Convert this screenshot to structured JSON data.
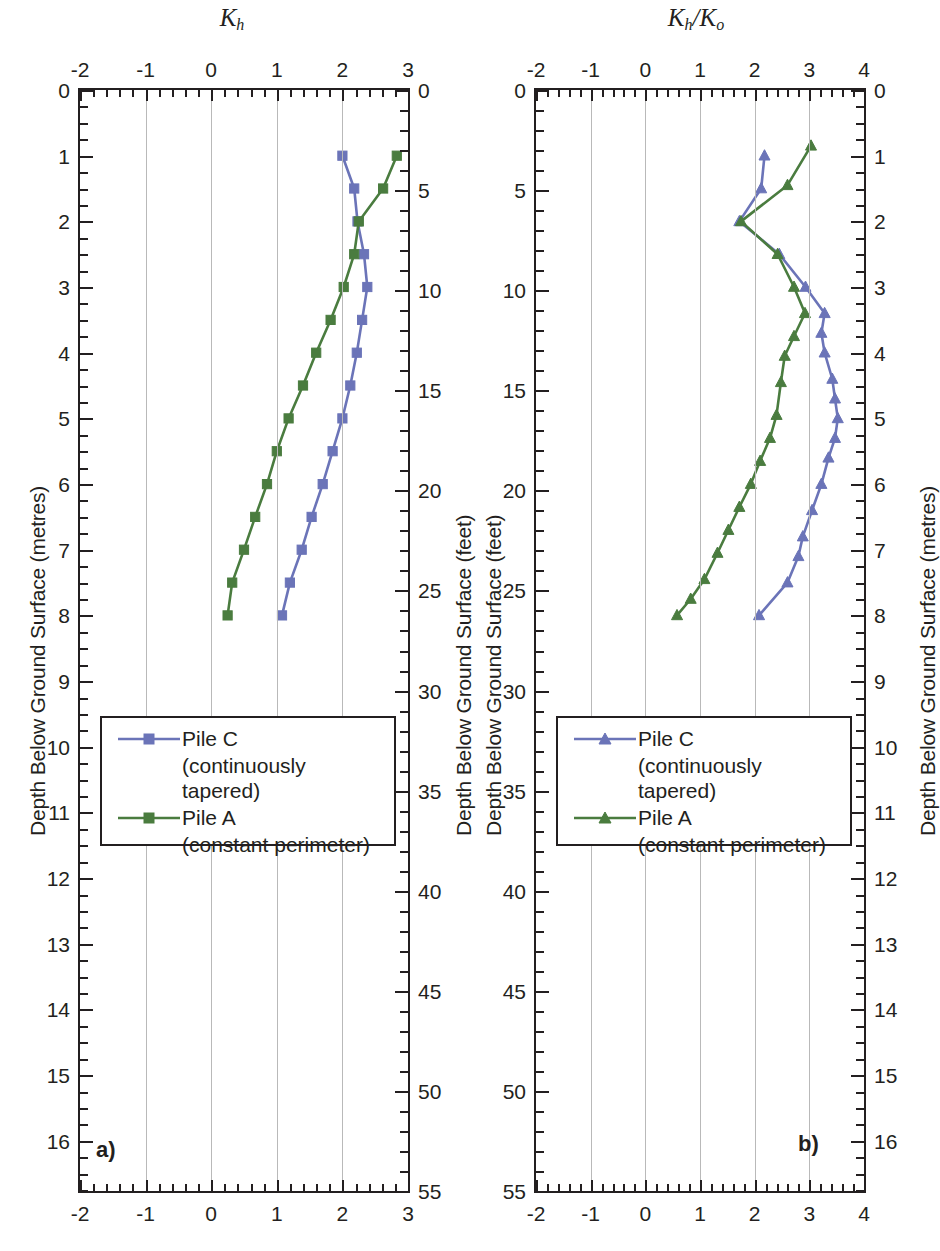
{
  "figure": {
    "panels": [
      {
        "tag": "a)",
        "x_axis_title": "K",
        "x_axis_title_sub": "h",
        "x_axis_title_full": "Kh",
        "x_ticks": [
          -2,
          -1,
          0,
          1,
          2,
          3
        ],
        "x_min": -2,
        "x_max": 3,
        "x_minor_step": 0.2,
        "left_axis_label": "Depth Below Ground Surface (metres)",
        "left_ticks": [
          0,
          1,
          2,
          3,
          4,
          5,
          6,
          7,
          8,
          9,
          10,
          11,
          12,
          13,
          14,
          15,
          16
        ],
        "left_min": 0,
        "left_max": 16.764,
        "left_minor_step": 0.25,
        "right_axis_label": "Depth Below Ground Surface (feet)",
        "right_ticks": [
          0,
          5,
          10,
          15,
          20,
          25,
          30,
          35,
          40,
          45,
          50,
          55
        ],
        "right_min": 0,
        "right_max": 55,
        "right_minor_step": 1,
        "legend": {
          "items": [
            {
              "name": "Pile C",
              "sub": "(continuously tapered)",
              "color": "#6b74b8",
              "marker": "square"
            },
            {
              "name": "Pile A",
              "sub": "(constant perimeter)",
              "color": "#4a7c3f",
              "marker": "square"
            }
          ]
        }
      },
      {
        "tag": "b)",
        "x_axis_title": "K",
        "x_axis_title_sub": "h",
        "x_axis_title_sub2": "o",
        "x_axis_title_full": "Kh/Ko",
        "x_ticks": [
          -2,
          -1,
          0,
          1,
          2,
          3,
          4
        ],
        "x_min": -2,
        "x_max": 4,
        "x_minor_step": 0.2,
        "left_axis_label": "Depth Below Ground Surface (feet)",
        "left_ticks": [
          0,
          5,
          10,
          15,
          20,
          25,
          30,
          35,
          40,
          45,
          50,
          55
        ],
        "left_min": 0,
        "left_max": 55,
        "left_minor_step": 1,
        "right_axis_label": "Depth Below Ground Surface (metres)",
        "right_ticks": [
          0,
          1,
          2,
          3,
          4,
          5,
          6,
          7,
          8,
          9,
          10,
          11,
          12,
          13,
          14,
          15,
          16
        ],
        "right_min": 0,
        "right_max": 16.764,
        "right_minor_step": 0.25,
        "legend": {
          "items": [
            {
              "name": "Pile C",
              "sub": "(continuously tapered)",
              "color": "#6b74b8",
              "marker": "triangle"
            },
            {
              "name": "Pile A",
              "sub": "(constant perimeter)",
              "color": "#4a7c3f",
              "marker": "triangle"
            }
          ]
        }
      }
    ]
  },
  "chart_data": [
    {
      "type": "line",
      "title": "Kh",
      "panel": "a)",
      "xlabel": "Kh",
      "ylabel": "Depth Below Ground Surface (metres)",
      "ylabel_secondary": "Depth Below Ground Surface (feet)",
      "xlim": [
        -2,
        3
      ],
      "ylim": [
        0,
        16.764
      ],
      "ylim_secondary": [
        0,
        55
      ],
      "y_inverted": true,
      "grid": true,
      "legend_position": "lower-left-inside",
      "series": [
        {
          "name": "Pile C",
          "sublabel": "(continuously tapered)",
          "color": "#6b74b8",
          "marker": "square",
          "points": [
            {
              "depth_m": 1.0,
              "value": 2.0
            },
            {
              "depth_m": 1.5,
              "value": 2.18
            },
            {
              "depth_m": 2.0,
              "value": 2.23
            },
            {
              "depth_m": 2.5,
              "value": 2.33
            },
            {
              "depth_m": 3.0,
              "value": 2.38
            },
            {
              "depth_m": 3.5,
              "value": 2.3
            },
            {
              "depth_m": 4.0,
              "value": 2.22
            },
            {
              "depth_m": 4.5,
              "value": 2.12
            },
            {
              "depth_m": 5.0,
              "value": 2.0
            },
            {
              "depth_m": 5.5,
              "value": 1.85
            },
            {
              "depth_m": 6.0,
              "value": 1.7
            },
            {
              "depth_m": 6.5,
              "value": 1.53
            },
            {
              "depth_m": 7.0,
              "value": 1.38
            },
            {
              "depth_m": 7.5,
              "value": 1.2
            },
            {
              "depth_m": 8.0,
              "value": 1.08
            }
          ]
        },
        {
          "name": "Pile A",
          "sublabel": "(constant perimeter)",
          "color": "#4a7c3f",
          "marker": "square",
          "points": [
            {
              "depth_m": 1.0,
              "value": 2.83
            },
            {
              "depth_m": 1.5,
              "value": 2.62
            },
            {
              "depth_m": 2.0,
              "value": 2.25
            },
            {
              "depth_m": 2.5,
              "value": 2.18
            },
            {
              "depth_m": 3.0,
              "value": 2.02
            },
            {
              "depth_m": 3.5,
              "value": 1.82
            },
            {
              "depth_m": 4.0,
              "value": 1.6
            },
            {
              "depth_m": 4.5,
              "value": 1.4
            },
            {
              "depth_m": 5.0,
              "value": 1.18
            },
            {
              "depth_m": 5.5,
              "value": 1.0
            },
            {
              "depth_m": 6.0,
              "value": 0.85
            },
            {
              "depth_m": 6.5,
              "value": 0.67
            },
            {
              "depth_m": 7.0,
              "value": 0.5
            },
            {
              "depth_m": 7.5,
              "value": 0.32
            },
            {
              "depth_m": 8.0,
              "value": 0.25
            }
          ]
        }
      ]
    },
    {
      "type": "line",
      "title": "Kh/Ko",
      "panel": "b)",
      "xlabel": "Kh/Ko",
      "ylabel": "Depth Below Ground Surface (feet)",
      "ylabel_secondary": "Depth Below Ground Surface (metres)",
      "xlim": [
        -2,
        4
      ],
      "ylim": [
        0,
        55
      ],
      "ylim_secondary": [
        0,
        16.764
      ],
      "y_inverted": true,
      "grid": true,
      "legend_position": "lower-left-inside",
      "series": [
        {
          "name": "Pile C",
          "sublabel": "(continuously tapered)",
          "color": "#6b74b8",
          "marker": "triangle",
          "points": [
            {
              "depth_m": 1.0,
              "value": 2.18
            },
            {
              "depth_m": 1.5,
              "value": 2.12
            },
            {
              "depth_m": 2.0,
              "value": 1.72
            },
            {
              "depth_m": 2.5,
              "value": 2.45
            },
            {
              "depth_m": 3.0,
              "value": 2.93
            },
            {
              "depth_m": 3.4,
              "value": 3.28
            },
            {
              "depth_m": 3.7,
              "value": 3.22
            },
            {
              "depth_m": 4.0,
              "value": 3.28
            },
            {
              "depth_m": 4.4,
              "value": 3.42
            },
            {
              "depth_m": 4.7,
              "value": 3.47
            },
            {
              "depth_m": 5.0,
              "value": 3.52
            },
            {
              "depth_m": 5.3,
              "value": 3.47
            },
            {
              "depth_m": 5.6,
              "value": 3.35
            },
            {
              "depth_m": 6.0,
              "value": 3.22
            },
            {
              "depth_m": 6.4,
              "value": 3.05
            },
            {
              "depth_m": 6.8,
              "value": 2.88
            },
            {
              "depth_m": 7.1,
              "value": 2.8
            },
            {
              "depth_m": 7.5,
              "value": 2.6
            },
            {
              "depth_m": 8.0,
              "value": 2.08
            }
          ]
        },
        {
          "name": "Pile A",
          "sublabel": "(constant perimeter)",
          "color": "#4a7c3f",
          "marker": "triangle",
          "points": [
            {
              "depth_m": 0.85,
              "value": 3.03
            },
            {
              "depth_m": 1.45,
              "value": 2.6
            },
            {
              "depth_m": 2.0,
              "value": 1.75
            },
            {
              "depth_m": 2.5,
              "value": 2.42
            },
            {
              "depth_m": 3.0,
              "value": 2.72
            },
            {
              "depth_m": 3.4,
              "value": 2.92
            },
            {
              "depth_m": 3.75,
              "value": 2.72
            },
            {
              "depth_m": 4.05,
              "value": 2.55
            },
            {
              "depth_m": 4.45,
              "value": 2.48
            },
            {
              "depth_m": 4.95,
              "value": 2.4
            },
            {
              "depth_m": 5.3,
              "value": 2.28
            },
            {
              "depth_m": 5.65,
              "value": 2.1
            },
            {
              "depth_m": 6.0,
              "value": 1.93
            },
            {
              "depth_m": 6.35,
              "value": 1.72
            },
            {
              "depth_m": 6.7,
              "value": 1.52
            },
            {
              "depth_m": 7.05,
              "value": 1.32
            },
            {
              "depth_m": 7.45,
              "value": 1.08
            },
            {
              "depth_m": 7.75,
              "value": 0.83
            },
            {
              "depth_m": 8.0,
              "value": 0.58
            }
          ]
        }
      ]
    }
  ]
}
